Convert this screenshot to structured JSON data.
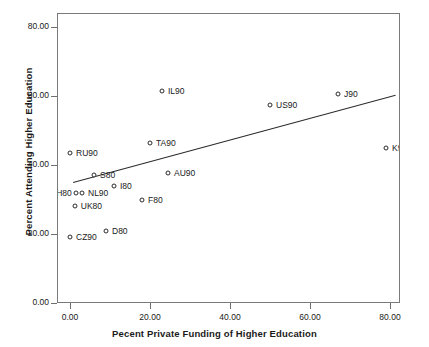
{
  "chart_data": {
    "type": "scatter",
    "title": "",
    "xlabel": "Pecent Private Funding of Higher Education",
    "ylabel": "Percent Attending Higher Education",
    "xlim": [
      -4,
      84
    ],
    "ylim": [
      -4,
      84
    ],
    "xticks": [
      "0.00",
      "20.00",
      "40.00",
      "60.00",
      "80.00"
    ],
    "xtick_values": [
      0,
      20,
      40,
      60,
      80
    ],
    "yticks": [
      "0.00",
      "20.00",
      "40.00",
      "60.00",
      "80.00"
    ],
    "ytick_values": [
      0,
      20,
      40,
      60,
      80
    ],
    "grid": false,
    "legend": false,
    "marker": "open-circle",
    "points": [
      {
        "label": "RU90",
        "x": 0.0,
        "y": 43.5,
        "lx": 6,
        "ly": 0
      },
      {
        "label": "CZ90",
        "x": 0.0,
        "y": 19.0,
        "lx": 6,
        "ly": 0
      },
      {
        "label": "CH80",
        "x": 1.5,
        "y": 32.0,
        "lx": -26,
        "ly": 0
      },
      {
        "label": "UK80",
        "x": 1.2,
        "y": 28.0,
        "lx": 6,
        "ly": 0
      },
      {
        "label": "NL90",
        "x": 3.0,
        "y": 32.0,
        "lx": 6,
        "ly": 0
      },
      {
        "label": "S80",
        "x": 6.0,
        "y": 37.0,
        "lx": 6,
        "ly": 0
      },
      {
        "label": "D80",
        "x": 9.0,
        "y": 20.8,
        "lx": 6,
        "ly": 0
      },
      {
        "label": "I80",
        "x": 11.0,
        "y": 34.0,
        "lx": 6,
        "ly": 0
      },
      {
        "label": "F80",
        "x": 18.0,
        "y": 30.0,
        "lx": 6,
        "ly": 0
      },
      {
        "label": "TA90",
        "x": 20.0,
        "y": 46.5,
        "lx": 6,
        "ly": 0
      },
      {
        "label": "IL90",
        "x": 23.0,
        "y": 61.5,
        "lx": 6,
        "ly": 0
      },
      {
        "label": "AU90",
        "x": 24.5,
        "y": 37.7,
        "lx": 6,
        "ly": 0
      },
      {
        "label": "US90",
        "x": 50.0,
        "y": 57.5,
        "lx": 6,
        "ly": 0
      },
      {
        "label": "J90",
        "x": 67.0,
        "y": 60.5,
        "lx": 6,
        "ly": 0
      },
      {
        "label": "K90",
        "x": 79.0,
        "y": 45.0,
        "lx": 6,
        "ly": 0
      }
    ],
    "fit_line": {
      "x0": 0.8,
      "y0": 35.0,
      "x1": 81.5,
      "y1": 60.3
    }
  }
}
